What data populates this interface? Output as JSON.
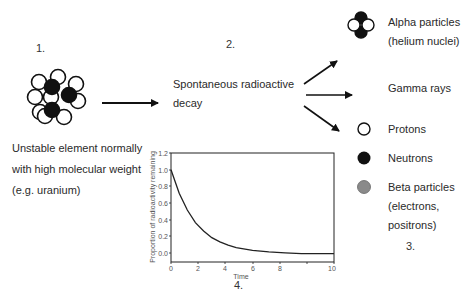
{
  "steps": {
    "step1": {
      "number": "1.",
      "description": [
        "Unstable element normally",
        "with high molecular weight",
        "(e.g. uranium)"
      ]
    },
    "step2": {
      "number": "2.",
      "description": [
        "Spontaneous radioactive",
        "decay"
      ]
    },
    "step3": {
      "number": "3."
    },
    "step4": {
      "number": "4."
    }
  },
  "products": [
    {
      "icon": "alpha-particle-icon",
      "lines": [
        "Alpha particles",
        "(helium nuclei)"
      ]
    },
    {
      "icon": "none",
      "lines": [
        "Gamma rays"
      ]
    }
  ],
  "legend": [
    {
      "icon": "proton-icon",
      "label": "Protons",
      "color": "#ffffff"
    },
    {
      "icon": "neutron-icon",
      "label": "Neutrons",
      "color": "#111111"
    },
    {
      "icon": "beta-particle-icon",
      "label": "Beta particles",
      "extra": [
        "(electrons,",
        "positrons)"
      ],
      "color": "#8a8a8a"
    }
  ],
  "chart_data": {
    "type": "line",
    "title": "",
    "xlabel": "Time",
    "ylabel": "Proportion of radioactivity remaining",
    "xlim": [
      0,
      10
    ],
    "ylim": [
      -0.1,
      1.2
    ],
    "xticks": [
      "0",
      "2",
      "4",
      "6",
      "8",
      "10"
    ],
    "yticks": [
      "0.0",
      "0.2",
      "0.4",
      "0.6",
      "0.8",
      "1.0",
      "1.2"
    ],
    "grid": false,
    "series": [
      {
        "name": "decay",
        "x": [
          0,
          0.5,
          1,
          1.5,
          2,
          2.5,
          3,
          3.5,
          4,
          5,
          6,
          7,
          8,
          9,
          10
        ],
        "values": [
          1.0,
          0.72,
          0.52,
          0.37,
          0.27,
          0.19,
          0.14,
          0.1,
          0.07,
          0.04,
          0.02,
          0.01,
          0.0,
          0.0,
          0.0
        ]
      }
    ]
  }
}
